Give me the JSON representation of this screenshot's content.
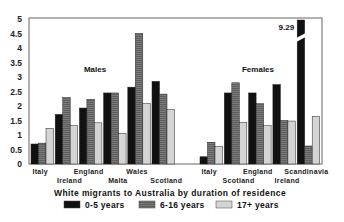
{
  "chart_data": {
    "type": "bar",
    "title": "White migrants to Australia by duration of residence",
    "xlabel": "",
    "ylabel": "",
    "ylim": [
      0,
      5
    ],
    "yticks": [
      "0",
      "0.5",
      "1",
      "1.5",
      "2",
      "2.5",
      "3",
      "3.5",
      "4",
      "4.5",
      "5"
    ],
    "grid": false,
    "legend_position": "bottom",
    "legend": [
      "0-5 years",
      "6-16 years",
      "17+ years"
    ],
    "colors": {
      "0-5 years": "#111111",
      "6-16 years": "#7a7a7a",
      "17+ years": "#d4d4d4"
    },
    "groups": [
      {
        "name": "Males",
        "categories": [
          "Italy",
          "Ireland",
          "England",
          "Malta",
          "Wales",
          "Scotland"
        ],
        "series": [
          {
            "name": "0-5 years",
            "values": [
              0.69,
              1.71,
              1.93,
              2.45,
              2.65,
              2.85
            ]
          },
          {
            "name": "6-16 years",
            "values": [
              0.72,
              2.29,
              2.23,
              2.45,
              4.5,
              2.41
            ]
          },
          {
            "name": "17+ years",
            "values": [
              1.23,
              1.33,
              1.42,
              1.06,
              2.08,
              1.88
            ]
          }
        ]
      },
      {
        "name": "Females",
        "categories": [
          "Italy",
          "Scotland",
          "England",
          "Ireland",
          "Scandinavia"
        ],
        "series": [
          {
            "name": "0-5 years",
            "values": [
              0.25,
              2.45,
              2.45,
              2.74,
              9.29
            ]
          },
          {
            "name": "6-16 years",
            "values": [
              0.75,
              2.8,
              2.08,
              1.5,
              0.62
            ]
          },
          {
            "name": "17+ years",
            "values": [
              0.6,
              1.43,
              1.32,
              1.48,
              1.64
            ]
          }
        ]
      }
    ],
    "annotations": [
      {
        "text": "9.29",
        "target": "Females / Scandinavia / 0-5 years",
        "note": "broken bar, exceeds axis"
      }
    ]
  }
}
